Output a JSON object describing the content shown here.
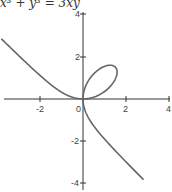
{
  "chart_data": {
    "type": "line",
    "title": "x³ + y³ = 3xy",
    "xlabel": "",
    "ylabel": "",
    "xlim": [
      -3.8,
      4.1
    ],
    "ylim": [
      -4.1,
      4.1
    ],
    "x_ticks": [
      -2,
      0,
      2,
      4
    ],
    "y_ticks": [
      -4,
      -2,
      2,
      4
    ],
    "x_tick_labels": [
      "-2",
      "0",
      "2",
      "4"
    ],
    "y_tick_labels": [
      "-4",
      "-2",
      "2",
      "4"
    ],
    "grid": false,
    "legend": null,
    "series": [
      {
        "name": "Folium of Descartes",
        "equation": "x^3 + y^3 = 3xy",
        "color": "#666666",
        "description": "loop in first quadrant from (0,0) through (1.5,1.5); branches asymptotic to x + y + 1 = 0"
      }
    ]
  },
  "title_text": "x³ + y³ = 3xy",
  "ticks": {
    "xm2": "-2",
    "x0": "0",
    "x2": "2",
    "x4": "4",
    "y4": "4",
    "y2": "2",
    "ym2": "-2",
    "ym4": "-4"
  },
  "colors": {
    "curve": "#666666",
    "axis": "#333333"
  }
}
